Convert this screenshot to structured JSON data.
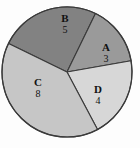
{
  "figure": {
    "background_color": "#fdfdfd",
    "outline_color": "#3a3a3a"
  },
  "chart_data": {
    "type": "pie",
    "title": "",
    "subtitle": "",
    "xlabel": "",
    "ylabel": "",
    "grid": false,
    "legend": "none",
    "label_mode": "letter-over-value-inside-slice",
    "total": 20,
    "degrees_per_unit": 18,
    "center": {
      "x": 67,
      "y": 72
    },
    "radius": 65,
    "start_angle_deg": -64,
    "direction": "clockwise",
    "categories": [
      "A",
      "B",
      "C",
      "D"
    ],
    "values": [
      3,
      5,
      8,
      4
    ],
    "slices": [
      {
        "label": "A",
        "value": "3",
        "numeric_value": 3,
        "angle_deg": 54,
        "color": "#9a9a9a",
        "start_deg": -64,
        "end_deg": -10
      },
      {
        "label": "B",
        "value": "5",
        "numeric_value": 5,
        "angle_deg": 90,
        "color": "#828282",
        "start_deg": -154,
        "end_deg": -64
      },
      {
        "label": "C",
        "value": "8",
        "numeric_value": 8,
        "angle_deg": 144,
        "color": "#c6c6c6",
        "start_deg": 62,
        "end_deg": 206
      },
      {
        "label": "D",
        "value": "4",
        "numeric_value": 4,
        "angle_deg": 72,
        "color": "#d7d7d7",
        "start_deg": -10,
        "end_deg": 62
      }
    ]
  }
}
